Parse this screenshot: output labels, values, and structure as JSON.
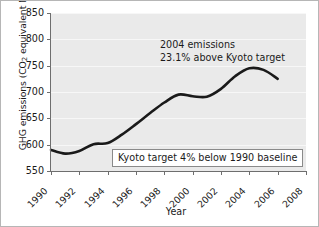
{
  "chart_data": {
    "type": "line",
    "title": "",
    "xlabel": "Year",
    "ylabel": "GHG emissions (CO2 equivalent Mt)",
    "ylabel_parts": {
      "before": "GHG emissions (CO",
      "subscript": "2",
      "after": " equivalent Mt)"
    },
    "xlim": [
      1990,
      2008
    ],
    "ylim": [
      550,
      850
    ],
    "xticks": [
      1990,
      1992,
      1994,
      1996,
      1998,
      2000,
      2002,
      2004,
      2006,
      2008
    ],
    "yticks": [
      550,
      600,
      650,
      700,
      750,
      800,
      850
    ],
    "grid": "horizontal",
    "legend": "none",
    "plot_background": "#eaeaea",
    "line_color": "#1a1a1a",
    "series": [
      {
        "name": "GHG emissions",
        "x": [
          1990,
          1991,
          1992,
          1993,
          1994,
          1995,
          1996,
          1997,
          1998,
          1999,
          2000,
          2001,
          2002,
          2003,
          2004,
          2005,
          2006
        ],
        "values": [
          590,
          583,
          588,
          601,
          603,
          619,
          639,
          660,
          680,
          695,
          692,
          691,
          706,
          730,
          745,
          742,
          725
        ]
      }
    ],
    "annotations": [
      {
        "name": "emissions-note",
        "line1": "2004 emissions",
        "line2": "23.1% above Kyoto target"
      },
      {
        "name": "kyoto-target-note",
        "text": "Kyoto target 4% below 1990 baseline"
      }
    ]
  }
}
